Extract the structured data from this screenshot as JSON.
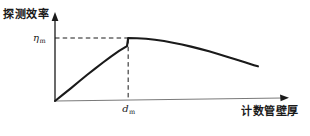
{
  "figure": {
    "background_color": "#ffffff",
    "ink_color": "#1a1a1a",
    "width": 310,
    "height": 136
  },
  "axes": {
    "y_title": "探测效率",
    "x_title": "计数管壁厚",
    "y_tick_symbol": "η",
    "y_tick_subscript": "m",
    "x_tick_symbol": "d",
    "x_tick_subscript": "m",
    "origin_x": 55,
    "origin_y": 101,
    "y_axis_top": 14,
    "x_axis_right": 288
  },
  "chart_data": {
    "type": "line",
    "title": "",
    "xlabel": "计数管壁厚",
    "ylabel": "探测效率",
    "xlim": [
      0,
      1
    ],
    "ylim": [
      0,
      1
    ],
    "grid": false,
    "legend": false,
    "annotations": [
      {
        "name": "peak-efficiency",
        "label": "η_m",
        "axis": "y",
        "value": 0.72
      },
      {
        "name": "optimal-thickness",
        "label": "d_m",
        "axis": "x",
        "value": 0.314
      }
    ],
    "series": [
      {
        "name": "detection-efficiency-curve",
        "x": [
          0.0,
          0.034,
          0.069,
          0.103,
          0.137,
          0.172,
          0.206,
          0.24,
          0.275,
          0.309,
          0.314,
          0.352,
          0.391,
          0.429,
          0.468,
          0.506,
          0.545,
          0.584,
          0.622,
          0.661,
          0.7,
          0.738,
          0.777,
          0.815,
          0.854,
          0.871
        ],
        "y": [
          0.0,
          0.073,
          0.148,
          0.224,
          0.299,
          0.372,
          0.443,
          0.511,
          0.575,
          0.631,
          0.724,
          0.722,
          0.715,
          0.704,
          0.689,
          0.67,
          0.649,
          0.625,
          0.599,
          0.571,
          0.541,
          0.51,
          0.478,
          0.445,
          0.412,
          0.398
        ]
      }
    ],
    "guide_lines": [
      {
        "name": "horizontal-guide",
        "from": [
          0,
          0.724
        ],
        "to": [
          0.314,
          0.724
        ],
        "style": "dashed"
      },
      {
        "name": "vertical-guide",
        "from": [
          0.314,
          0
        ],
        "to": [
          0.314,
          0.724
        ],
        "style": "dashed"
      }
    ]
  }
}
